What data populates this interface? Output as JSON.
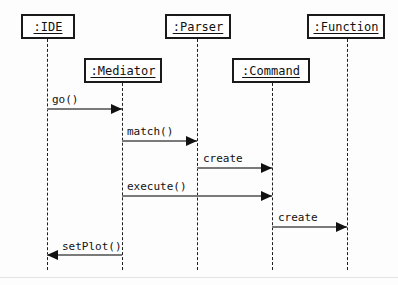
{
  "diagram": {
    "type": "uml-sequence-diagram",
    "width": 398,
    "height": 285,
    "background_color": "#fdfdfd",
    "box_border_color": "#1a1a1a",
    "lifeline_color": "#1f1f1f",
    "message_line_color": "#7a7a7a",
    "arrowhead_color": "#111111",
    "text_color": "#111111"
  },
  "participants": [
    {
      "id": "ide",
      "label": ":IDE",
      "box": {
        "x": 21,
        "y": 14,
        "width": 54,
        "height": 25
      },
      "lifeline_x": 47,
      "lifeline_top": 39,
      "lifeline_bottom": 270
    },
    {
      "id": "mediator",
      "label": ":Mediator",
      "box": {
        "x": 84,
        "y": 58,
        "width": 78,
        "height": 25
      },
      "lifeline_x": 122,
      "lifeline_top": 83,
      "lifeline_bottom": 270
    },
    {
      "id": "parser",
      "label": ":Parser",
      "box": {
        "x": 165,
        "y": 14,
        "width": 66,
        "height": 25
      },
      "lifeline_x": 197,
      "lifeline_top": 39,
      "lifeline_bottom": 270
    },
    {
      "id": "command",
      "label": ":Command",
      "box": {
        "x": 232,
        "y": 58,
        "width": 78,
        "height": 25
      },
      "lifeline_x": 272,
      "lifeline_top": 83,
      "lifeline_bottom": 270
    },
    {
      "id": "function",
      "label": ":Function",
      "box": {
        "x": 307,
        "y": 14,
        "width": 78,
        "height": 25
      },
      "lifeline_x": 347,
      "lifeline_top": 39,
      "lifeline_bottom": 270
    }
  ],
  "messages": [
    {
      "id": "msg-go",
      "label": "go()",
      "from": "ide",
      "to": "mediator",
      "direction": "right",
      "x1": 47,
      "x2": 122,
      "y": 108,
      "label_x": 52,
      "label_y": 93
    },
    {
      "id": "msg-match",
      "label": "match()",
      "from": "mediator",
      "to": "parser",
      "direction": "right",
      "x1": 122,
      "x2": 197,
      "y": 140,
      "label_x": 127,
      "label_y": 125
    },
    {
      "id": "msg-create-command",
      "label": "create",
      "from": "parser",
      "to": "command",
      "direction": "right",
      "x1": 197,
      "x2": 272,
      "y": 167,
      "label_x": 203,
      "label_y": 152
    },
    {
      "id": "msg-execute",
      "label": "execute()",
      "from": "mediator",
      "to": "command",
      "direction": "right",
      "x1": 122,
      "x2": 272,
      "y": 195,
      "label_x": 127,
      "label_y": 180
    },
    {
      "id": "msg-create-function",
      "label": "create",
      "from": "command",
      "to": "function",
      "direction": "right",
      "x1": 272,
      "x2": 347,
      "y": 226,
      "label_x": 278,
      "label_y": 211
    },
    {
      "id": "msg-setplot",
      "label": "setPlot()",
      "from": "mediator",
      "to": "ide",
      "direction": "left",
      "x1": 122,
      "x2": 47,
      "y": 254,
      "label_x": 62,
      "label_y": 240
    }
  ],
  "page_rule": {
    "y": 277
  }
}
